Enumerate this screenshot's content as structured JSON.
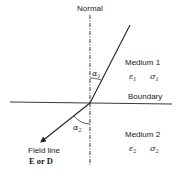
{
  "diagram": {
    "labels": {
      "normal": "Normal",
      "boundary": "Boundary",
      "medium1": "Medium 1",
      "medium2": "Medium 2",
      "field_line_1": "Field line",
      "field_line_2": "E or D"
    },
    "medium1_params": {
      "epsilon": "ε",
      "epsilon_sub": "1",
      "sigma": "σ",
      "sigma_sub": "1"
    },
    "medium2_params": {
      "epsilon": "ε",
      "epsilon_sub": "2",
      "sigma": "σ",
      "sigma_sub": "2"
    },
    "angles": {
      "alpha1": "α",
      "alpha1_sub": "1",
      "alpha2": "α",
      "alpha2_sub": "2"
    },
    "colors": {
      "line": "#222222",
      "background": "#ffffff"
    }
  }
}
